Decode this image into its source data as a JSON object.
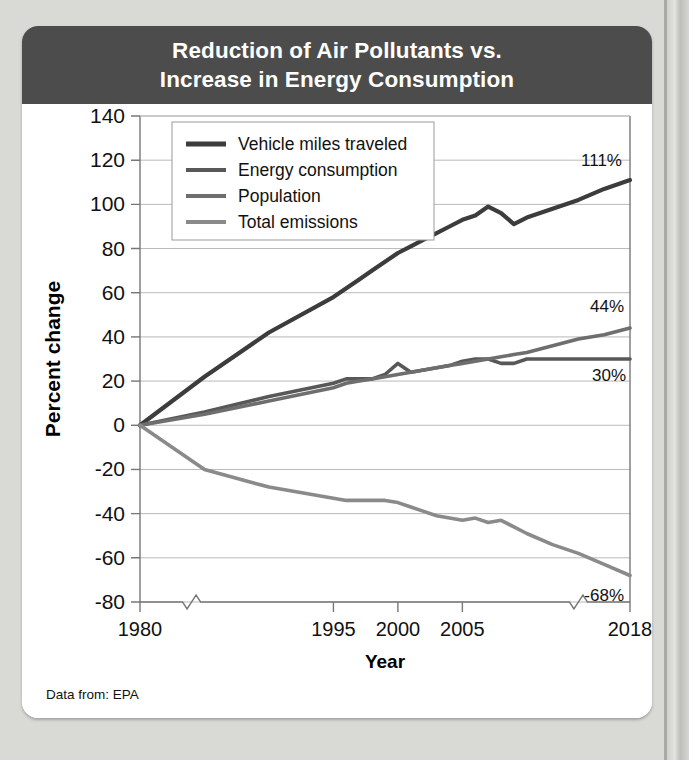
{
  "card": {
    "title_lines": [
      "Reduction of Air Pollutants vs.",
      "Increase in Energy Consumption"
    ],
    "source_note": "Data from: EPA"
  },
  "colors": {
    "header_bg": "#4c4c4c",
    "page_bg": "#d9d9d6",
    "card_bg": "#ffffff",
    "vehicle_miles": "#3c3c3c",
    "energy_consumption": "#585858",
    "population": "#6e6e6e",
    "total_emissions": "#8a8a8a",
    "gridline": "#b9b9b9",
    "axis": "#777777"
  },
  "chart_data": {
    "type": "line",
    "title": "Reduction of Air Pollutants vs. Increase in Energy Consumption",
    "xlabel": "Year",
    "ylabel": "Percent change",
    "xlim": [
      1980,
      2018
    ],
    "ylim": [
      -80,
      140
    ],
    "ytick_step": 20,
    "yticks": [
      140,
      120,
      100,
      80,
      60,
      40,
      20,
      0,
      -20,
      -40,
      -60,
      -80
    ],
    "xticks": [
      1980,
      1995,
      2000,
      2005,
      2018
    ],
    "axis_break": true,
    "axis_break_positions": [
      1984,
      2014
    ],
    "grid": "horizontal",
    "legend_position": "top-left",
    "x": [
      1980,
      1985,
      1990,
      1995,
      1996,
      1997,
      1998,
      1999,
      2000,
      2001,
      2002,
      2003,
      2004,
      2005,
      2006,
      2007,
      2008,
      2009,
      2010,
      2012,
      2014,
      2016,
      2018
    ],
    "series": [
      {
        "name": "Vehicle miles traveled",
        "color": "#3c3c3c",
        "end_label": "111%",
        "end_value": 111,
        "values": [
          0,
          22,
          42,
          58,
          62,
          66,
          70,
          74,
          78,
          81,
          84,
          87,
          90,
          93,
          95,
          99,
          96,
          91,
          94,
          98,
          102,
          107,
          111
        ]
      },
      {
        "name": "Energy consumption",
        "color": "#585858",
        "end_label": "30%",
        "end_value": 30,
        "values": [
          0,
          6,
          13,
          19,
          21,
          21,
          21,
          23,
          28,
          24,
          25,
          26,
          27,
          29,
          30,
          30,
          28,
          28,
          30,
          30,
          30,
          30,
          30
        ]
      },
      {
        "name": "Population",
        "color": "#6e6e6e",
        "end_label": "44%",
        "end_value": 44,
        "values": [
          0,
          5,
          11,
          17,
          19,
          20,
          21,
          22,
          23,
          24,
          25,
          26,
          27,
          28,
          29,
          30,
          31,
          32,
          33,
          36,
          39,
          41,
          44
        ]
      },
      {
        "name": "Total emissions",
        "color": "#8a8a8a",
        "end_label": "-68%",
        "end_value": -68,
        "values": [
          0,
          -20,
          -28,
          -33,
          -34,
          -34,
          -34,
          -34,
          -35,
          -37,
          -39,
          -41,
          -42,
          -43,
          -42,
          -44,
          -43,
          -46,
          -49,
          -54,
          -58,
          -63,
          -68
        ]
      }
    ]
  }
}
